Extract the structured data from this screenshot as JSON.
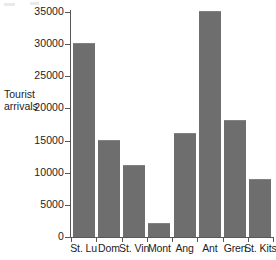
{
  "chart_data": {
    "type": "bar",
    "title": "",
    "xlabel": "",
    "ylabel": "Tourist arrivals",
    "ylabel_lines": [
      "Tourist",
      "arrivals"
    ],
    "categories": [
      "St. Lu",
      "Dom",
      "St. Vin",
      "Mont",
      "Ang",
      "Ant",
      "Gren",
      "St. Kits"
    ],
    "values": [
      30000,
      15000,
      11000,
      2000,
      16000,
      35000,
      18000,
      8800
    ],
    "ylim": [
      0,
      35000
    ],
    "ytick_values": [
      0,
      5000,
      10000,
      15000,
      20000,
      25000,
      30000,
      35000
    ],
    "ytick_labels": [
      "0",
      "5000",
      "10000",
      "15000",
      "20000",
      "25000",
      "30000",
      "35000"
    ],
    "grid": false,
    "legend": null,
    "bar_color": "#6e6e6e",
    "axis_color": "#585858",
    "background": "#ffffff"
  }
}
